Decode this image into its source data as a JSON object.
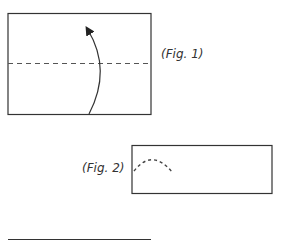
{
  "figures": [
    {
      "id": "fig1",
      "label": "(Fig. 1)",
      "description": "Rectangle with horizontal dashed fold line and curved arrow pointing upward"
    },
    {
      "id": "fig2",
      "label": "(Fig. 2)",
      "description": "Folded narrow rectangle with dashed arc at left edge"
    },
    {
      "id": "fig3",
      "description": "Partially visible rectangle top edge"
    }
  ],
  "colors": {
    "stroke": "#333333",
    "dash": "#444444",
    "background": "#ffffff"
  }
}
